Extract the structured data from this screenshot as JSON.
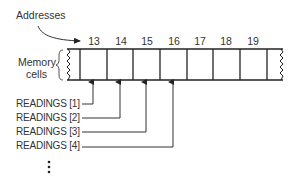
{
  "diagram": {
    "addresses_label": "Addresses",
    "memory_cells_label_line1": "Memory",
    "memory_cells_label_line2": "cells",
    "addresses": [
      "13",
      "14",
      "15",
      "16",
      "17",
      "18",
      "19"
    ],
    "readings": [
      {
        "label": "READINGS [1]",
        "points_to_address": "13"
      },
      {
        "label": "READINGS [2]",
        "points_to_address": "14"
      },
      {
        "label": "READINGS [3]",
        "points_to_address": "15"
      },
      {
        "label": "READINGS [4]",
        "points_to_address": "16"
      }
    ],
    "continuation": "⋮"
  }
}
